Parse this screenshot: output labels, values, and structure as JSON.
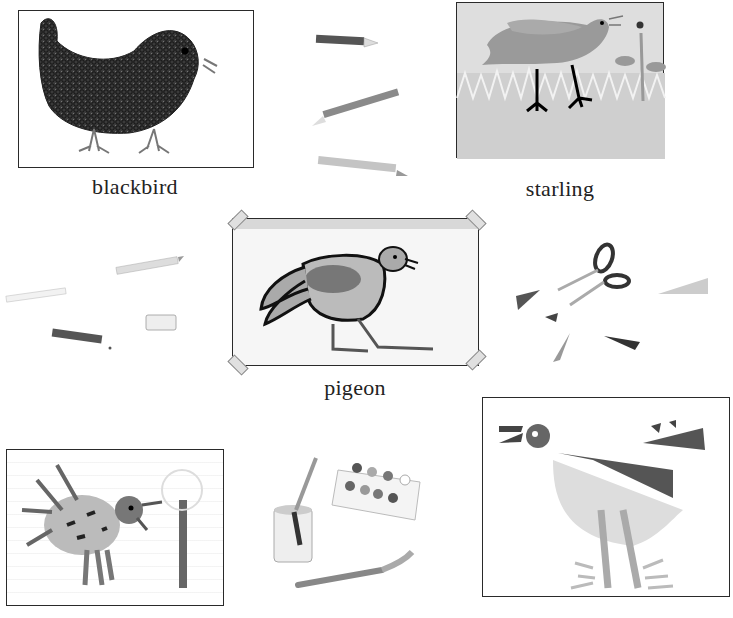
{
  "page": {
    "background": "#ffffff",
    "ink_color": "#222222"
  },
  "drawings": [
    {
      "id": "blackbird",
      "label": "blackbird",
      "style": "scribbled crayon on white card",
      "frame": "rectangle"
    },
    {
      "id": "starling",
      "label": "starling",
      "style": "grey wash with dark legs and grass",
      "frame": "rectangle"
    },
    {
      "id": "pigeon",
      "label": "pigeon",
      "style": "outlined bird taped at corners",
      "frame": "taped rectangle"
    },
    {
      "id": "crayon-bird",
      "label": "",
      "style": "crayon bird on lined notebook page",
      "frame": "spiral-torn page"
    },
    {
      "id": "cut-paper-bird",
      "label": "",
      "style": "cut paper collage bird",
      "frame": "wavy-edged paper"
    }
  ],
  "props": [
    {
      "id": "pencils-top",
      "name": "pencils",
      "count": 3
    },
    {
      "id": "pencils-left",
      "name": "pencils",
      "count": 3
    },
    {
      "id": "eraser",
      "name": "eraser"
    },
    {
      "id": "scissors",
      "name": "scissors"
    },
    {
      "id": "paper-triangles",
      "name": "cut paper scraps",
      "count": 6
    },
    {
      "id": "paint-jar",
      "name": "water jar with brush"
    },
    {
      "id": "paint-box",
      "name": "watercolour paint box",
      "wells": 8
    },
    {
      "id": "paintbrush",
      "name": "paintbrush"
    }
  ]
}
